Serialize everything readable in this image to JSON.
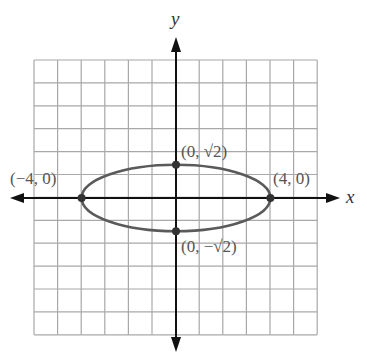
{
  "chart_data": {
    "type": "line",
    "title": "",
    "xlabel": "x",
    "ylabel": "y",
    "xlim": [
      -6,
      6
    ],
    "ylim": [
      -6,
      6
    ],
    "grid": true,
    "curve": {
      "kind": "ellipse",
      "equation": "x^2/16 + y^2/2 = 1",
      "center": [
        0,
        0
      ],
      "semi_major_x": 4,
      "semi_minor_y": 1.414
    },
    "points": [
      {
        "x": -4,
        "y": 0,
        "label": "(−4, 0)"
      },
      {
        "x": 4,
        "y": 0,
        "label": "(4, 0)"
      },
      {
        "x": 0,
        "y": 1.414,
        "label": "(0, √2)"
      },
      {
        "x": 0,
        "y": -1.414,
        "label": "(0, −√2)"
      }
    ]
  },
  "labels": {
    "x_axis": "x",
    "y_axis": "y",
    "p_left": "(−4, 0)",
    "p_right": "(4, 0)",
    "p_top": "(0, √2)",
    "p_bottom": "(0, −√2)"
  },
  "colors": {
    "grid": "#a8a8a8",
    "axis": "#111111",
    "curve": "#5a5a5a",
    "point": "#333333"
  }
}
